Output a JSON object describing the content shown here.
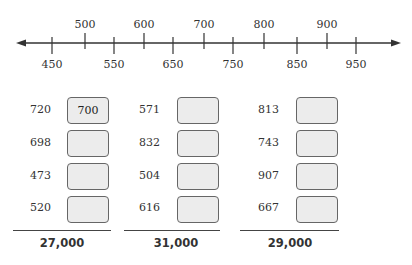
{
  "number_line": {
    "upper_labels": [
      {
        "label": "500",
        "x": 85
      },
      {
        "label": "600",
        "x": 144
      },
      {
        "label": "700",
        "x": 204
      },
      {
        "label": "800",
        "x": 264
      },
      {
        "label": "900",
        "x": 327
      }
    ],
    "lower_labels": [
      {
        "label": "450",
        "x": 52
      },
      {
        "label": "550",
        "x": 114
      },
      {
        "label": "650",
        "x": 173
      },
      {
        "label": "750",
        "x": 233
      },
      {
        "label": "850",
        "x": 297
      },
      {
        "label": "950",
        "x": 356
      }
    ]
  },
  "columns": [
    {
      "numbers": [
        "720",
        "698",
        "473",
        "520"
      ],
      "answers": [
        "700",
        "",
        "",
        ""
      ],
      "total": "27,000"
    },
    {
      "numbers": [
        "571",
        "832",
        "504",
        "616"
      ],
      "answers": [
        "",
        "",
        "",
        ""
      ],
      "total": "31,000"
    },
    {
      "numbers": [
        "813",
        "743",
        "907",
        "667"
      ],
      "answers": [
        "",
        "",
        "",
        ""
      ],
      "total": "29,000"
    }
  ]
}
